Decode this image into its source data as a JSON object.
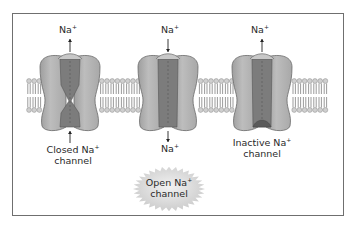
{
  "diagram": {
    "ion_symbol": "Na",
    "ion_charge": "+",
    "channels": [
      {
        "state": "closed",
        "label_line1": "Closed Na",
        "label_sup": "+",
        "label_line2": "channel",
        "top_ion": "Na",
        "top_ion_charge": "+",
        "top_arrow_direction": "up",
        "bottom_arrow_direction": "up",
        "bottom_ion": null
      },
      {
        "state": "open",
        "label_line1": "Open Na",
        "label_sup": "+",
        "label_line2": "channel",
        "label_style": "starburst",
        "top_ion": "Na",
        "top_ion_charge": "+",
        "top_arrow_direction": "down",
        "bottom_arrow_direction": "down",
        "bottom_ion": "Na",
        "bottom_ion_charge": "+"
      },
      {
        "state": "inactive",
        "label_line1": "Inactive Na",
        "label_sup": "+",
        "label_line2": "channel",
        "top_ion": "Na",
        "top_ion_charge": "+",
        "top_arrow_direction": "up",
        "bottom_arrow_direction": null,
        "bottom_ion": null
      }
    ],
    "colors": {
      "protein_outer": "#b3b3b3",
      "protein_outline": "#6a6a6a",
      "protein_pore": "#7c7c7c",
      "lipid_head": "#cfcfcf",
      "lipid_tail": "#707070",
      "starburst": "#d6d6d6",
      "frame": "#6f6f6f"
    }
  }
}
